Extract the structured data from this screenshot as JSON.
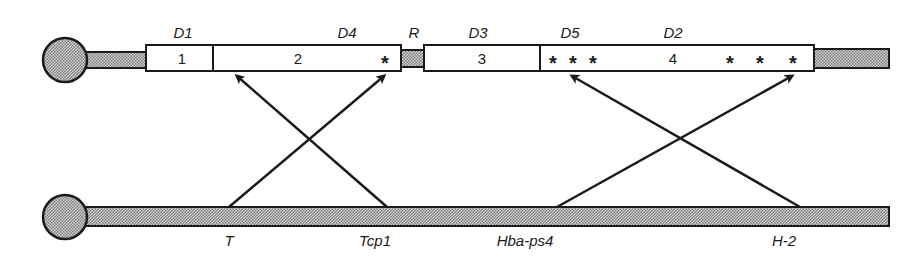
{
  "diagram": {
    "type": "chromosome-homology-map",
    "colors": {
      "stroke": "#1a1a1a",
      "shading": "#b8b8b8",
      "background": "#ffffff"
    },
    "top_chromosome": {
      "labels": {
        "d1": "D1",
        "d4": "D4",
        "r": "R",
        "d3": "D3",
        "d5": "D5",
        "d2": "D2"
      },
      "segments": {
        "seg1": "1",
        "seg2": "2",
        "seg3": "3",
        "seg4": "4"
      },
      "asterisk": "*"
    },
    "bottom_chromosome": {
      "loci": {
        "t": "T",
        "tcp1": "Tcp1",
        "hba_ps4": "Hba-ps4",
        "h2": "H-2"
      }
    },
    "arrows": [
      {
        "from": "T",
        "to": "segment 2 (near D4)"
      },
      {
        "from": "Tcp1",
        "to": "segment 2 (left end)"
      },
      {
        "from": "Hba-ps4",
        "to": "segment 4 (right end)"
      },
      {
        "from": "H-2",
        "to": "segment 4 (near D5)"
      }
    ]
  }
}
